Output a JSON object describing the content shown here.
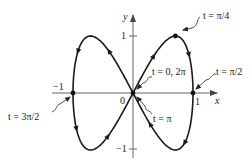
{
  "figure": {
    "axes": {
      "x_label": "x",
      "y_label": "y",
      "origin_label": "0",
      "x_ticks": [
        {
          "value": -1,
          "label": "−1"
        },
        {
          "value": 1,
          "label": "1"
        }
      ],
      "y_ticks": [
        {
          "value": 1,
          "label": "1"
        },
        {
          "value": -1,
          "label": "−1"
        }
      ]
    },
    "annotations": [
      {
        "id": "t_pi_over_4",
        "label": "t = π/4",
        "point": [
          0.707,
          1
        ]
      },
      {
        "id": "t_0_2pi",
        "label": "t = 0, 2π",
        "point": [
          0,
          0
        ]
      },
      {
        "id": "t_pi_over_2",
        "label": "t = π/2",
        "point": [
          1,
          0
        ]
      },
      {
        "id": "t_pi",
        "label": "t = π",
        "point": [
          0,
          0
        ]
      },
      {
        "id": "t_3pi_over_2",
        "label": "t = 3π/2",
        "point": [
          -1,
          0
        ]
      }
    ],
    "colors": {
      "curve": "#1a1a1a",
      "axes": "#555555",
      "text": "#222222",
      "background": "#ffffff"
    }
  }
}
